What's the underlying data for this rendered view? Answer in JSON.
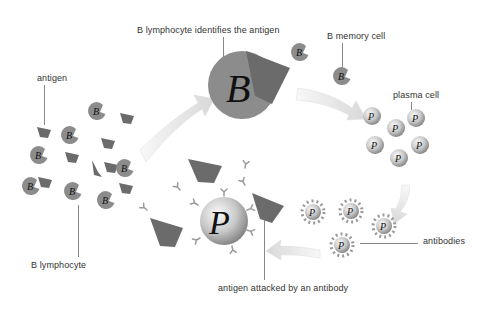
{
  "diagram": {
    "type": "B lymphocyte immune response cycle",
    "labels": {
      "antigen": "antigen",
      "b_lymphocyte": "B lymphocyte",
      "identifies": "B lymphocyte identifies the antigen",
      "memory_cell": "B memory cell",
      "plasma_cell": "plasma cell",
      "antibodies": "antibodies",
      "attacked": "antigen attacked by an antibody"
    },
    "cell_letters": {
      "b_cell": "B",
      "plasma": "P"
    },
    "colors": {
      "b_cell": "#8c8c8c",
      "antigen": "#6b6b6b",
      "plasma_light": "#f2f2f2",
      "plasma_dark": "#8a8a8a",
      "arrow": "#e6e6e6",
      "antibody": "#9a9a9a",
      "text": "#333333"
    }
  }
}
